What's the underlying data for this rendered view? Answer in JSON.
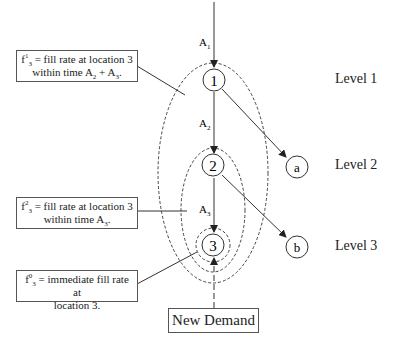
{
  "nodes": {
    "n1": "1",
    "n2": "2",
    "n3": "3",
    "na": "a",
    "nb": "b"
  },
  "edge_labels": {
    "a1": "A",
    "a1_sub": "1",
    "a2": "A",
    "a2_sub": "2",
    "a3": "A",
    "a3_sub": "3"
  },
  "levels": [
    "Level 1",
    "Level 2",
    "Level 3"
  ],
  "notes": [
    {
      "f": "f",
      "sup": "1",
      "sub": "3",
      "line1_rest": " = fill rate at location 3",
      "line2": "within time A",
      "line2_sub1": "2",
      "line2_mid": " + A",
      "line2_sub2": "3",
      "line2_end": "."
    },
    {
      "f": "f",
      "sup": "2",
      "sub": "3",
      "line1_rest": " = fill rate at location 3",
      "line2": "within time A",
      "line2_sub1": "3",
      "line2_end": "."
    },
    {
      "f": "f",
      "sup": "0",
      "sub": "3",
      "line1_rest": " = immediate fill rate at",
      "line2": "location 3."
    }
  ],
  "demand_label": "New Demand",
  "colors": {
    "line": "#333333",
    "dash": "#444444"
  }
}
